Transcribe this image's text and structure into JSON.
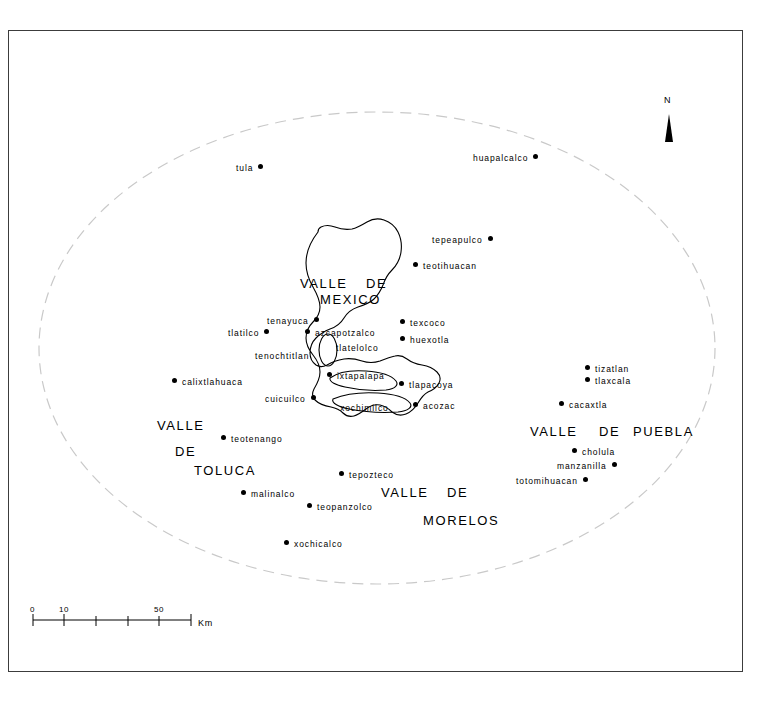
{
  "map": {
    "title": "Valley of Mexico archaeological sites map",
    "background_color": "#ffffff",
    "frame_color": "#3c3c3c",
    "lake_outline_color": "#000000",
    "boundary_ellipse_color": "#c9c9c9",
    "north": {
      "label": "N",
      "icon": "north-arrow-icon"
    },
    "scale": {
      "ticks": [
        "0",
        "10",
        "50"
      ],
      "unit": "Km"
    },
    "regions": [
      {
        "name": "valle-de-mexico",
        "words": [
          "VALLE",
          "DE",
          "MEXICO"
        ]
      },
      {
        "name": "valle-de-toluca",
        "words": [
          "VALLE",
          "DE",
          "TOLUCA"
        ]
      },
      {
        "name": "valle-de-morelos",
        "words": [
          "VALLE",
          "DE",
          "MORELOS"
        ]
      },
      {
        "name": "valle-de-puebla",
        "words": [
          "VALLE",
          "DE",
          "PUEBLA"
        ]
      }
    ],
    "sites": [
      {
        "id": "tula",
        "label": "tula",
        "dot": "right"
      },
      {
        "id": "huapalcalco",
        "label": "huapalcalco",
        "dot": "right"
      },
      {
        "id": "tepeapulco",
        "label": "tepeapulco",
        "dot": "right"
      },
      {
        "id": "teotihuacan",
        "label": "teotihuacan",
        "dot": "left"
      },
      {
        "id": "tenayuca",
        "label": "tenayuca",
        "dot": "right"
      },
      {
        "id": "tlatilco",
        "label": "tlatilco",
        "dot": "right"
      },
      {
        "id": "azcapotzalco",
        "label": "azcapotzalco",
        "dot": "left"
      },
      {
        "id": "texcoco",
        "label": "texcoco",
        "dot": "left"
      },
      {
        "id": "huexotla",
        "label": "huexotla",
        "dot": "left"
      },
      {
        "id": "tlatelolco",
        "label": "tlatelolco",
        "dot": "none"
      },
      {
        "id": "tenochtitlan",
        "label": "tenochtitlan",
        "dot": "none"
      },
      {
        "id": "calixtlahuaca",
        "label": "calixtlahuaca",
        "dot": "left"
      },
      {
        "id": "ixtapalapa",
        "label": "ixtapalapa",
        "dot": "left"
      },
      {
        "id": "tlapacoya",
        "label": "tlapacoya",
        "dot": "left"
      },
      {
        "id": "tizatlan",
        "label": "tizatlan",
        "dot": "left"
      },
      {
        "id": "tlaxcala",
        "label": "tlaxcala",
        "dot": "left"
      },
      {
        "id": "cacaxtla",
        "label": "cacaxtla",
        "dot": "left"
      },
      {
        "id": "cuicuilco",
        "label": "cuicuilco",
        "dot": "right"
      },
      {
        "id": "xochimilco",
        "label": "xochimilco",
        "dot": "none"
      },
      {
        "id": "acozac",
        "label": "acozac",
        "dot": "left"
      },
      {
        "id": "teotenango",
        "label": "teotenango",
        "dot": "left"
      },
      {
        "id": "cholula",
        "label": "cholula",
        "dot": "left"
      },
      {
        "id": "manzanilla",
        "label": "manzanilla",
        "dot": "right"
      },
      {
        "id": "totomihuacan",
        "label": "totomihuacan",
        "dot": "right"
      },
      {
        "id": "tepozteco",
        "label": "tepozteco",
        "dot": "left"
      },
      {
        "id": "malinalco",
        "label": "malinalco",
        "dot": "left"
      },
      {
        "id": "teopanzolco",
        "label": "teopanzolco",
        "dot": "left"
      },
      {
        "id": "xochicalco",
        "label": "xochicalco",
        "dot": "left"
      }
    ]
  }
}
